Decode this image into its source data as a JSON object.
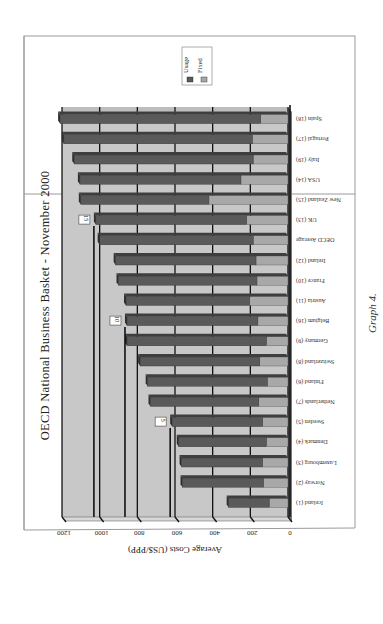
{
  "page": {
    "caption": "Graph 4.",
    "orientation": "chart rotated 180 degrees on the page"
  },
  "chart_data": {
    "type": "bar",
    "orientation": "horizontal",
    "stacked": true,
    "three_d": true,
    "title": "OECD National Business Basket - November 2000",
    "xlabel": "",
    "ylabel": "Average Costs (US$/PPP)",
    "ylim": [
      0,
      1200
    ],
    "ticks": [
      0,
      200,
      400,
      600,
      800,
      1000,
      1200
    ],
    "grid": true,
    "legend": {
      "position": "top-right (rotated)",
      "entries": [
        "Usage",
        "Fixed"
      ]
    },
    "colors": {
      "Usage": "#5a5a5a",
      "Fixed": "#a8a8a8",
      "plot_bg": "#c8c8c8"
    },
    "categories": [
      "Iceland (1)",
      "Norway (2)",
      "Luxembourg (3)",
      "Denmark (4)",
      "Sweden (5)",
      "Netherlands (7)",
      "Finland (6)",
      "Switzerland (8)",
      "Germany (9)",
      "Belgium (16)",
      "Austria (11)",
      "France (10)",
      "Ireland (12)",
      "OECD Average",
      "UK (13)",
      "New Zealand (15)",
      "USA (14)",
      "Italy (19)",
      "Portugal (17)",
      "Spain (18)"
    ],
    "series": [
      {
        "name": "Fixed",
        "values": [
          100,
          130,
          135,
          115,
          135,
          155,
          110,
          150,
          115,
          160,
          205,
          165,
          170,
          185,
          220,
          420,
          250,
          185,
          190,
          145
        ]
      },
      {
        "name": "Usage",
        "values": [
          215,
          430,
          430,
          465,
          480,
          575,
          635,
          635,
          740,
          695,
          655,
          735,
          745,
          815,
          800,
          680,
          855,
          950,
          1000,
          1065
        ]
      }
    ],
    "totals": [
      315,
      560,
      565,
      580,
      615,
      730,
      745,
      785,
      855,
      855,
      860,
      900,
      915,
      1000,
      1020,
      1100,
      1105,
      1135,
      1190,
      1210
    ],
    "annotations": [
      {
        "label": "5",
        "near": "Sweden (5)"
      },
      {
        "label": "10",
        "near": "Belgium (16)"
      },
      {
        "label": "15",
        "near": "UK (13)"
      }
    ]
  }
}
